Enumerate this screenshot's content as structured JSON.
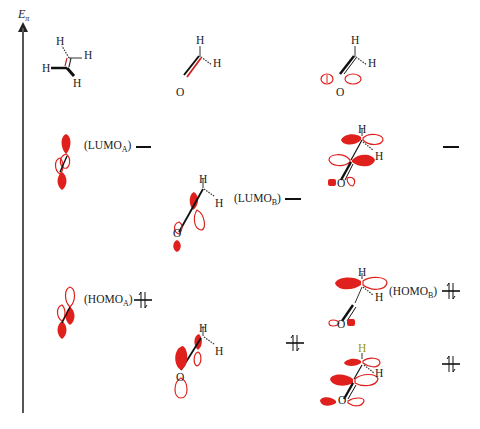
{
  "axis": {
    "label_main": "E",
    "label_sub": "π"
  },
  "row1": {
    "ethylene": {
      "atoms": [
        "H",
        "H",
        "H",
        "H"
      ]
    },
    "formaldehyde": {
      "atoms": [
        "H",
        "H",
        "O"
      ]
    },
    "formaldehyde_lonepair": {
      "atoms": [
        "H",
        "H",
        "O"
      ]
    }
  },
  "levels": {
    "lumo_a": {
      "prefix": "(LUMO",
      "sub": "A",
      "suffix": ")"
    },
    "lumo_b": {
      "prefix": "(LUMO",
      "sub": "B",
      "suffix": ")"
    },
    "homo_a": {
      "prefix": "(HOMO",
      "sub": "A",
      "suffix": ")"
    },
    "homo_b": {
      "prefix": "(HOMO",
      "sub": "B",
      "suffix": ")"
    }
  },
  "atoms": {
    "H": "H",
    "O": "O"
  },
  "colors": {
    "lobe_fill": "#e0201c",
    "lobe_outline": "#e0201c",
    "bond": "#111111",
    "axis": "#555555",
    "highlight_h": "#9a9a00"
  }
}
